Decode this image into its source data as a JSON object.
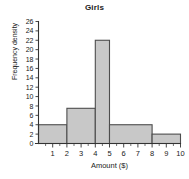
{
  "chart_data": {
    "type": "bar",
    "title": "Girls",
    "xlabel": "Amount ($)",
    "ylabel": "Frequency density",
    "xlim": [
      0,
      10
    ],
    "ylim": [
      0,
      26
    ],
    "grid": false,
    "legend": "none",
    "bar_fill_color": "#c8c8c8",
    "bar_edge_color": "#4d4d4d",
    "axis_color": "#333333",
    "xticks": [
      1,
      2,
      3,
      4,
      5,
      6,
      7,
      8,
      9,
      10
    ],
    "xtick_labels": [
      "1",
      "2",
      "3",
      "4",
      "5",
      "6",
      "7",
      "8",
      "9",
      "10"
    ],
    "yticks": [
      0,
      2,
      4,
      6,
      8,
      10,
      12,
      14,
      16,
      18,
      20,
      22,
      24,
      26
    ],
    "ytick_labels": [
      "0",
      "2",
      "4",
      "6",
      "8",
      "10",
      "12",
      "14",
      "16",
      "18",
      "20",
      "22",
      "24",
      "26"
    ],
    "bins": [
      {
        "label": "0-2",
        "x0": 0,
        "x1": 2,
        "value": 4
      },
      {
        "label": "2-4",
        "x0": 2,
        "x1": 4,
        "value": 7.5
      },
      {
        "label": "4-5",
        "x0": 4,
        "x1": 5,
        "value": 22
      },
      {
        "label": "5-8",
        "x0": 5,
        "x1": 8,
        "value": 4
      },
      {
        "label": "8-10",
        "x0": 8,
        "x1": 10,
        "value": 2
      }
    ]
  }
}
